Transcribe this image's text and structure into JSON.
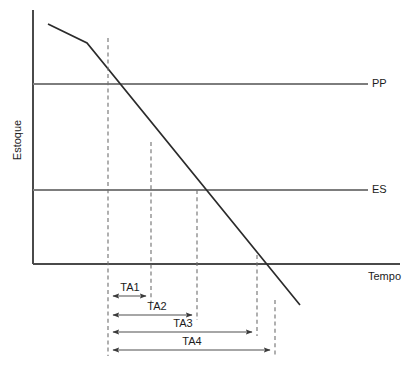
{
  "figure": {
    "title": "",
    "background_color": "#ffffff"
  },
  "axes": {
    "y_axis_label": "Estoque",
    "x_axis_label": "Tempo",
    "x_axis_y": 264,
    "y_axis_x": 33,
    "x_axis_start": 33,
    "x_axis_end": 400,
    "y_axis_top": 10,
    "axis_color": "#4a4a4a"
  },
  "levels": [
    {
      "id": "pp",
      "label": "PP",
      "description": "Ponto de Pedido",
      "y": 84,
      "x_start": 33,
      "x_end": 368,
      "label_x": 372,
      "color": "#7d7d7d"
    },
    {
      "id": "es",
      "label": "ES",
      "description": "Estoque de Seguranca",
      "y": 190,
      "x_start": 33,
      "x_end": 368,
      "label_x": 372,
      "color": "#7d7d7d"
    }
  ],
  "chart_data": {
    "type": "line",
    "title": "",
    "xlabel": "Tempo",
    "ylabel": "Estoque",
    "grid": false,
    "legend": "none",
    "series": [
      {
        "name": "Nivel de estoque",
        "color": "#2b2b2b",
        "points_px": [
          [
            48,
            24
          ],
          [
            87,
            43
          ],
          [
            300,
            305
          ]
        ],
        "description": "Curva de consumo de estoque decrescente com mudanca de inclinacao"
      }
    ],
    "reference_lines": [
      {
        "label": "PP",
        "y_px": 84
      },
      {
        "label": "ES",
        "y_px": 190
      }
    ],
    "event_markers_px": [
      108,
      151,
      197,
      257,
      275
    ],
    "annotations": [
      "TA1",
      "TA2",
      "TA3",
      "TA4",
      "PP",
      "ES",
      "Tempo",
      "Estoque"
    ]
  },
  "drop_lines": [
    {
      "id": "d1",
      "x": 108,
      "y_top": 38,
      "y_bottom": 356
    },
    {
      "id": "d2",
      "x": 151,
      "y_top": 142,
      "y_bottom": 302
    },
    {
      "id": "d3",
      "x": 197,
      "y_top": 190,
      "y_bottom": 320
    },
    {
      "id": "d4",
      "x": 257,
      "y_top": 255,
      "y_bottom": 336
    },
    {
      "id": "d5",
      "x": 275,
      "y_top": 300,
      "y_bottom": 356
    }
  ],
  "spans": [
    {
      "id": "ta1",
      "label": "TA1",
      "x_start": 108,
      "x_end": 151,
      "arrow_y": 296,
      "label_x": 130,
      "label_y": 291
    },
    {
      "id": "ta2",
      "label": "TA2",
      "x_start": 108,
      "x_end": 197,
      "arrow_y": 315,
      "label_x": 157,
      "label_y": 310
    },
    {
      "id": "ta3",
      "label": "TA3",
      "x_start": 108,
      "x_end": 257,
      "arrow_y": 332,
      "label_x": 183,
      "label_y": 327
    },
    {
      "id": "ta4",
      "label": "TA4",
      "x_start": 108,
      "x_end": 275,
      "arrow_y": 350,
      "label_x": 192,
      "label_y": 345
    }
  ],
  "labels": {
    "y_axis": {
      "text": "Estoque",
      "x": 18,
      "y": 140
    },
    "x_axis": {
      "text": "Tempo",
      "x": 368,
      "y": 272
    }
  }
}
